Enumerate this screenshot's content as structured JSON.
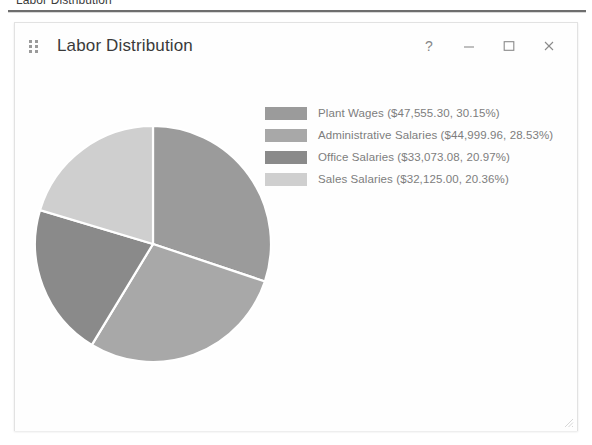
{
  "page": {
    "heading": "Labor Distribution"
  },
  "window": {
    "title": "Labor Distribution",
    "drag_handle_icon": "drag-dots-icon",
    "controls": [
      {
        "name": "help-button",
        "icon": "question-mark-icon",
        "glyph": "?"
      },
      {
        "name": "minimize-button",
        "icon": "minimize-icon",
        "glyph": "–"
      },
      {
        "name": "maximize-button",
        "icon": "maximize-icon",
        "glyph": "□"
      },
      {
        "name": "close-button",
        "icon": "close-icon",
        "glyph": "×"
      }
    ],
    "resize_grip_icon": "resize-grip-icon"
  },
  "chart_data": {
    "type": "pie",
    "title": "Labor Distribution",
    "legend_position": "right",
    "start_angle_deg": 0,
    "direction": "clockwise",
    "categories": [
      "Plant Wages",
      "Administrative Salaries",
      "Office Salaries",
      "Sales Salaries"
    ],
    "values": [
      47555.3,
      44999.96,
      33073.08,
      32125.0
    ],
    "percentages": [
      30.15,
      28.53,
      20.97,
      20.36
    ],
    "colors": [
      "#9b9b9b",
      "#a8a8a8",
      "#8a8a8a",
      "#cfcfcf"
    ],
    "slice_border_color": "#ffffff",
    "total": 157753.34,
    "currency": "$",
    "legend": [
      {
        "label": "Plant Wages ($47,555.30, 30.15%)",
        "color": "#9b9b9b"
      },
      {
        "label": "Administrative Salaries ($44,999.96, 28.53%)",
        "color": "#a8a8a8"
      },
      {
        "label": "Office Salaries ($33,073.08, 20.97%)",
        "color": "#8a8a8a"
      },
      {
        "label": "Sales Salaries ($32,125.00, 20.36%)",
        "color": "#cfcfcf"
      }
    ]
  }
}
